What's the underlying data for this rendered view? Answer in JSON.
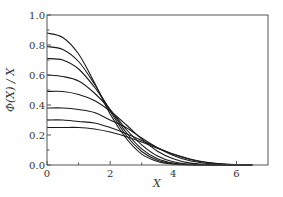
{
  "chart_data": {
    "type": "line",
    "title": "",
    "xlabel": "X",
    "ylabel": "Φ(X) / X",
    "xlim": [
      0,
      7
    ],
    "ylim": [
      0,
      1.0
    ],
    "xticks": [
      0,
      2,
      4,
      6
    ],
    "xtick_labels": [
      "0",
      "2",
      "4",
      "6"
    ],
    "xminor_ticks": [
      1,
      3,
      5
    ],
    "yticks": [
      0.0,
      0.2,
      0.4,
      0.6,
      0.8,
      1.0
    ],
    "ytick_labels": [
      "0.0",
      "0.2",
      "0.4",
      "0.6",
      "0.8",
      "1.0"
    ],
    "yminor_ticks": [
      0.1,
      0.3,
      0.5,
      0.7,
      0.9
    ],
    "grid": false,
    "legend": null,
    "line_color": "#1a1a1a",
    "x": [
      0,
      0.5,
      1.0,
      1.5,
      2.0,
      2.5,
      3.0,
      3.5,
      4.0,
      4.5,
      5.0,
      5.5,
      6.0,
      6.5
    ],
    "series": [
      {
        "name": "curve-1",
        "values": [
          0.88,
          0.85,
          0.74,
          0.55,
          0.34,
          0.18,
          0.073,
          0.024,
          0.006,
          0.001,
          0.0,
          0.0,
          0.0,
          0.0
        ]
      },
      {
        "name": "curve-2",
        "values": [
          0.79,
          0.77,
          0.69,
          0.54,
          0.36,
          0.2,
          0.09,
          0.032,
          0.009,
          0.002,
          0.0,
          0.0,
          0.0,
          0.0
        ]
      },
      {
        "name": "curve-3",
        "values": [
          0.71,
          0.7,
          0.64,
          0.52,
          0.37,
          0.22,
          0.107,
          0.042,
          0.013,
          0.003,
          0.001,
          0.0,
          0.0,
          0.0
        ]
      },
      {
        "name": "curve-4",
        "values": [
          0.6,
          0.59,
          0.56,
          0.48,
          0.37,
          0.24,
          0.135,
          0.06,
          0.021,
          0.006,
          0.001,
          0.0,
          0.0,
          0.0
        ]
      },
      {
        "name": "curve-5",
        "values": [
          0.49,
          0.49,
          0.47,
          0.43,
          0.36,
          0.27,
          0.172,
          0.092,
          0.041,
          0.014,
          0.004,
          0.001,
          0.0,
          0.0
        ]
      },
      {
        "name": "curve-6",
        "values": [
          0.38,
          0.38,
          0.37,
          0.35,
          0.3,
          0.25,
          0.18,
          0.115,
          0.064,
          0.03,
          0.012,
          0.004,
          0.001,
          0.0
        ]
      },
      {
        "name": "curve-7",
        "values": [
          0.3,
          0.3,
          0.29,
          0.28,
          0.25,
          0.21,
          0.164,
          0.115,
          0.072,
          0.039,
          0.018,
          0.007,
          0.002,
          0.001
        ]
      },
      {
        "name": "curve-8",
        "values": [
          0.25,
          0.25,
          0.25,
          0.24,
          0.22,
          0.19,
          0.153,
          0.112,
          0.073,
          0.042,
          0.02,
          0.008,
          0.003,
          0.001
        ]
      }
    ]
  }
}
